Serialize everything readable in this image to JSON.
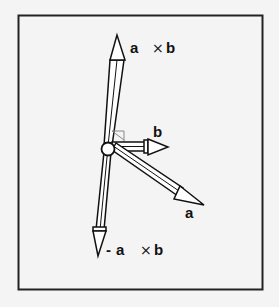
{
  "diagram": {
    "background": "#f4f4f4",
    "frame_color": "#222222",
    "right_angle_marker_color": "#888888",
    "vectors": [
      {
        "id": "a_cross_b",
        "label_a": "a",
        "label_op": "×",
        "label_b": "b",
        "prefix": ""
      },
      {
        "id": "b",
        "label": "b"
      },
      {
        "id": "a",
        "label": "a"
      },
      {
        "id": "neg_a_cross_b",
        "prefix": "-",
        "label_a": "a",
        "label_op": "×",
        "label_b": "b"
      }
    ]
  }
}
